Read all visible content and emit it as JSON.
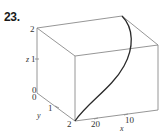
{
  "problem": {
    "number": "23."
  },
  "axes": {
    "z": {
      "label": "z",
      "ticks": [
        "0",
        "1",
        "2"
      ]
    },
    "y": {
      "label": "y",
      "ticks": [
        "0",
        "1",
        "2"
      ]
    },
    "x": {
      "label": "x",
      "ticks": [
        "10",
        "20"
      ]
    }
  },
  "labels": {
    "z_top": "2",
    "z_one": "1",
    "z_label": "z",
    "z_zero": "0",
    "y_zero": "0",
    "y_one": "1",
    "y_label": "y",
    "y_two": "2",
    "x_twenty": "20",
    "x_ten": "10",
    "x_label": "x"
  },
  "colors": {
    "box": "#8a8a8a",
    "curve": "#2a2a2a",
    "text": "#333333"
  }
}
